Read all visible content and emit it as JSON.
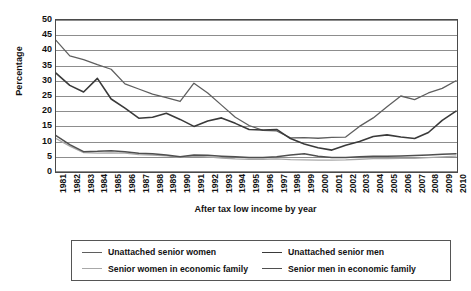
{
  "chart_data": {
    "type": "line",
    "title": "",
    "xlabel": "After tax low income by year",
    "ylabel": "Percentage",
    "ylim": [
      0,
      50
    ],
    "yticks": [
      0,
      5,
      10,
      15,
      20,
      25,
      30,
      35,
      40,
      45,
      50
    ],
    "grid": true,
    "legend_position": "bottom",
    "x": [
      1981,
      1982,
      1983,
      1984,
      1985,
      1986,
      1987,
      1988,
      1989,
      1990,
      1991,
      1992,
      1993,
      1994,
      1995,
      1996,
      1997,
      1998,
      1999,
      2000,
      2001,
      2002,
      2003,
      2004,
      2005,
      2006,
      2007,
      2008,
      2009,
      2010
    ],
    "categories": [
      "1981",
      "1982",
      "1983",
      "1984",
      "1985",
      "1986",
      "1987",
      "1988",
      "1989",
      "1990",
      "1991",
      "1992",
      "1993",
      "1994",
      "1995",
      "1996",
      "1997",
      "1998",
      "1999",
      "2000",
      "2001",
      "2002",
      "2003",
      "2004",
      "2005",
      "2006",
      "2007",
      "2008",
      "2009",
      "2010"
    ],
    "series": [
      {
        "name": "Unattached senior women",
        "color": "#5f5f5f",
        "width": 1.3,
        "values": [
          43.3,
          38.2,
          37.0,
          35.3,
          33.8,
          29.0,
          27.3,
          25.6,
          24.5,
          23.2,
          29.2,
          26.0,
          22.0,
          18.0,
          15.3,
          13.7,
          13.5,
          11.2,
          11.3,
          11.1,
          11.4,
          11.5,
          15.0,
          17.8,
          21.5,
          25.0,
          23.8,
          26.0,
          27.5,
          30.0
        ]
      },
      {
        "name": "Unattached senior men",
        "color": "#3a3a3a",
        "width": 1.6,
        "values": [
          32.5,
          28.5,
          26.3,
          30.8,
          24.0,
          21.0,
          17.7,
          18.0,
          19.3,
          17.3,
          15.0,
          16.8,
          17.8,
          16.0,
          14.0,
          13.8,
          14.0,
          11.0,
          9.2,
          8.0,
          7.2,
          8.8,
          10.0,
          11.7,
          12.2,
          11.5,
          11.0,
          13.0,
          17.0,
          20.0
        ]
      },
      {
        "name": "Senior women in economic family",
        "color": "#a8a8a8",
        "width": 1.3,
        "values": [
          11.0,
          8.5,
          6.4,
          6.2,
          6.3,
          6.2,
          5.7,
          5.6,
          5.3,
          4.8,
          5.2,
          5.0,
          4.6,
          4.3,
          4.2,
          4.2,
          4.3,
          4.1,
          4.0,
          3.9,
          3.9,
          4.0,
          4.2,
          4.4,
          4.4,
          4.5,
          4.5,
          4.7,
          5.0,
          5.2
        ]
      },
      {
        "name": "Senior men in economic family",
        "color": "#4f4f4f",
        "width": 1.5,
        "values": [
          12.0,
          9.0,
          6.7,
          6.8,
          7.0,
          6.7,
          6.2,
          6.0,
          5.6,
          5.0,
          5.6,
          5.5,
          5.2,
          5.0,
          4.8,
          4.8,
          5.0,
          5.6,
          6.0,
          5.2,
          4.8,
          4.8,
          5.0,
          5.2,
          5.2,
          5.3,
          5.4,
          5.6,
          5.8,
          6.0
        ]
      }
    ]
  },
  "legend": {
    "entries": [
      {
        "label": "Unattached senior women",
        "color": "#5f5f5f",
        "width": 1.3
      },
      {
        "label": "Unattached senior men",
        "color": "#3a3a3a",
        "width": 1.8
      },
      {
        "label": "Senior women in economic family",
        "color": "#a8a8a8",
        "width": 1.3
      },
      {
        "label": "Senior men in economic family",
        "color": "#4f4f4f",
        "width": 1.8
      }
    ]
  },
  "axes": {
    "grid_color": "#8d8d8d",
    "frame_color": "#4a4a4a"
  }
}
